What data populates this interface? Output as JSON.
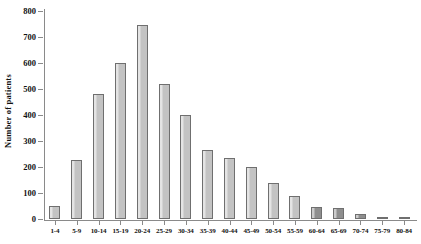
{
  "chart_data": {
    "type": "bar",
    "title": "",
    "xlabel": "",
    "ylabel": "Number of patients",
    "ylim": [
      0,
      800
    ],
    "ytick_values": [
      0,
      100,
      200,
      300,
      400,
      500,
      600,
      700,
      800
    ],
    "ytick_labels": [
      "0",
      "100",
      "200",
      "300",
      "400",
      "500",
      "600",
      "700",
      "800"
    ],
    "grid": false,
    "legend": null,
    "categories": [
      "1-4",
      "5-9",
      "10-14",
      "15-19",
      "20-24",
      "25-29",
      "30-34",
      "35-39",
      "40-44",
      "45-49",
      "50-54",
      "55-59",
      "60-64",
      "65-69",
      "70-74",
      "75-79",
      "80-84"
    ],
    "values": [
      50,
      228,
      482,
      600,
      745,
      520,
      400,
      265,
      235,
      200,
      140,
      90,
      48,
      42,
      20,
      6,
      5
    ],
    "bar_colors": [
      "#c3c3c3",
      "#c3c3c3",
      "#c3c3c3",
      "#c3c3c3",
      "#c3c3c3",
      "#c3c3c3",
      "#c3c3c3",
      "#c3c3c3",
      "#c3c3c3",
      "#c3c3c3",
      "#c3c3c3",
      "#c3c3c3",
      "#8e8e8e",
      "#8e8e8e",
      "#8e8e8e",
      "#8e8e8e",
      "#8e8e8e"
    ],
    "highlighted_categories": [
      "60-64",
      "65-69",
      "70-74",
      "75-79",
      "80-84"
    ],
    "axis_color": "#8a8a8a",
    "bar_edge_color": "#6f6f6f"
  }
}
